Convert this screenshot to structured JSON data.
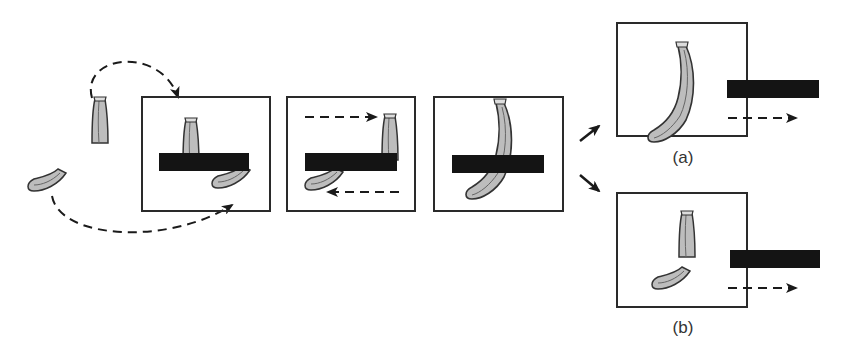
{
  "diagram": {
    "type": "occlusion-perception-sequence",
    "colors": {
      "panel_border": "#2a2a2a",
      "bar": "#141414",
      "banana_fill": "#bdbdbd",
      "banana_outline": "#333333",
      "arrow": "#1a1a1a"
    },
    "panels": [
      {
        "id": "step-1",
        "caption": "",
        "content": "banana top and bottom pieces arrive behind bar"
      },
      {
        "id": "step-2",
        "caption": "",
        "content": "pieces move in opposite directions behind bar"
      },
      {
        "id": "step-3",
        "caption": "",
        "content": "banana appears continuous behind bar"
      },
      {
        "id": "outcome-a",
        "caption": "(a)",
        "content": "bar moves right, revealing a complete banana"
      },
      {
        "id": "outcome-b",
        "caption": "(b)",
        "content": "bar moves right, revealing two separate pieces"
      }
    ],
    "labels": {
      "a": "(a)",
      "b": "(b)"
    }
  }
}
